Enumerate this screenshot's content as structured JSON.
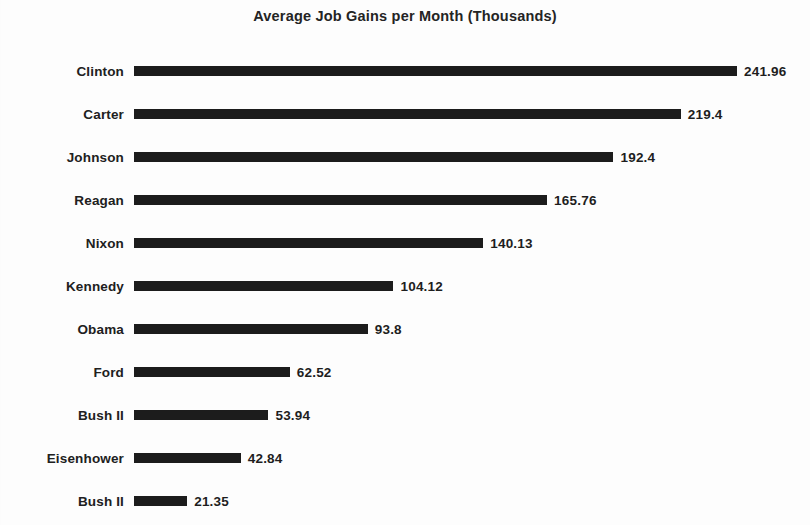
{
  "chart_data": {
    "type": "bar",
    "orientation": "horizontal",
    "title": "Average Job Gains per Month (Thousands)",
    "xlabel": "",
    "ylabel": "",
    "grid": false,
    "legend": null,
    "xlim": [
      0,
      241.96
    ],
    "bar_color": "#1c1c1c",
    "categories": [
      "Clinton",
      "Carter",
      "Johnson",
      "Reagan",
      "Nixon",
      "Kennedy",
      "Obama",
      "Ford",
      "Bush II",
      "Eisenhower",
      "Bush II"
    ],
    "values": [
      241.96,
      219.4,
      192.4,
      165.76,
      140.13,
      104.12,
      93.8,
      62.52,
      53.94,
      42.84,
      21.35
    ],
    "value_labels": [
      "241.96",
      "219.4",
      "192.4",
      "165.76",
      "140.13",
      "104.12",
      "93.8",
      "62.52",
      "53.94",
      "42.84",
      "21.35"
    ]
  }
}
